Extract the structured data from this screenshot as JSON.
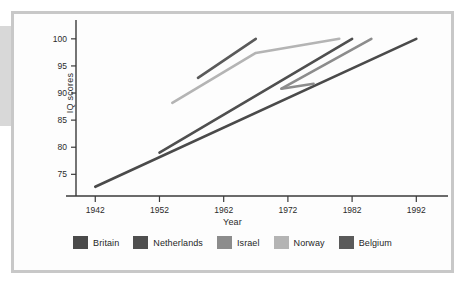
{
  "figure": {
    "frame_color": "#c8c8c8",
    "background": "#fdfdfd"
  },
  "chart_data": {
    "type": "line",
    "title": "",
    "xlabel": "Year",
    "ylabel": "IQ scores",
    "xlim": [
      1939,
      1996
    ],
    "ylim": [
      71,
      102
    ],
    "xticks": [
      1942,
      1952,
      1962,
      1972,
      1982,
      1992
    ],
    "yticks": [
      75,
      80,
      85,
      90,
      95,
      100
    ],
    "xtick_labels": [
      "1942",
      "1952",
      "1962",
      "1972",
      "1982",
      "1992"
    ],
    "ytick_labels": [
      "75",
      "80",
      "85",
      "90",
      "95",
      "100"
    ],
    "grid": false,
    "legend_position": "bottom",
    "series": [
      {
        "name": "Britain",
        "color": "#4a4a4a",
        "x": [
          1942,
          1992
        ],
        "y": [
          72.7,
          100.0
        ]
      },
      {
        "name": "Netherlands",
        "color": "#4f4f4f",
        "x": [
          1952,
          1982
        ],
        "y": [
          79.0,
          100.0
        ]
      },
      {
        "name": "Israel",
        "color": "#8c8c8c",
        "x": [
          1971,
          1985
        ],
        "y": [
          90.8,
          100.0
        ]
      },
      {
        "name": "Norway",
        "color": "#b4b4b4",
        "x": [
          1954,
          1967,
          1980
        ],
        "y": [
          88.2,
          97.4,
          100.0
        ]
      },
      {
        "name": "Belgium",
        "color": "#5a5a5a",
        "x": [
          1958,
          1967
        ],
        "y": [
          92.8,
          100.0
        ]
      }
    ],
    "extra_segments": [
      {
        "name": "Israel-dip",
        "color": "#8c8c8c",
        "x": [
          1971,
          1976
        ],
        "y": [
          90.8,
          91.7
        ]
      }
    ]
  },
  "legend": {
    "items": [
      {
        "label": "Britain",
        "color": "#4a4a4a"
      },
      {
        "label": "Netherlands",
        "color": "#4f4f4f"
      },
      {
        "label": "Israel",
        "color": "#8c8c8c"
      },
      {
        "label": "Norway",
        "color": "#b4b4b4"
      },
      {
        "label": "Belgium",
        "color": "#5a5a5a"
      }
    ]
  }
}
